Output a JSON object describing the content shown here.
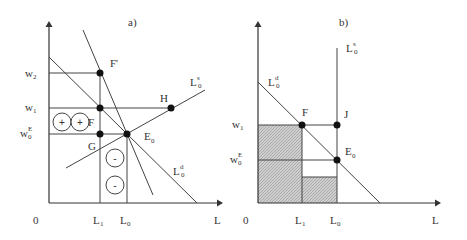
{
  "panel_a": {
    "title": "a)",
    "y_labels": {
      "w2": {
        "main": "w",
        "sub": "2"
      },
      "w1": {
        "main": "w",
        "sub": "1"
      },
      "wE0": {
        "main": "w",
        "sup": "E",
        "sub": "0"
      }
    },
    "x_labels": {
      "origin": "0",
      "L1": {
        "main": "L",
        "sub": "1"
      },
      "L0": {
        "main": "L",
        "sub": "0"
      },
      "axis": "L"
    },
    "points": {
      "F_prime": "F'",
      "F": "F",
      "G": "G",
      "E0": {
        "main": "E",
        "sub": "0"
      },
      "H": "H"
    },
    "curves": {
      "supply": {
        "main": "L",
        "sup": "s",
        "sub": "0"
      },
      "demand": {
        "main": "L",
        "sup": "d",
        "sub": "0"
      }
    },
    "gain_symbols": [
      "+",
      "+"
    ],
    "loss_symbols": [
      "-",
      "-"
    ]
  },
  "panel_b": {
    "title": "b)",
    "y_labels": {
      "w1": {
        "main": "w",
        "sub": "1"
      },
      "wE0": {
        "main": "w",
        "sup": "E",
        "sub": "0"
      }
    },
    "x_labels": {
      "origin": "0",
      "L1": {
        "main": "L",
        "sub": "1"
      },
      "L0": {
        "main": "L",
        "sub": "0"
      },
      "axis": "L"
    },
    "points": {
      "F": "F",
      "J": "J",
      "E0": {
        "main": "E",
        "sub": "0"
      }
    },
    "curves": {
      "supply": {
        "main": "L",
        "sup": "s",
        "sub": "0"
      },
      "demand": {
        "main": "L",
        "sup": "d",
        "sub": "0"
      }
    }
  }
}
